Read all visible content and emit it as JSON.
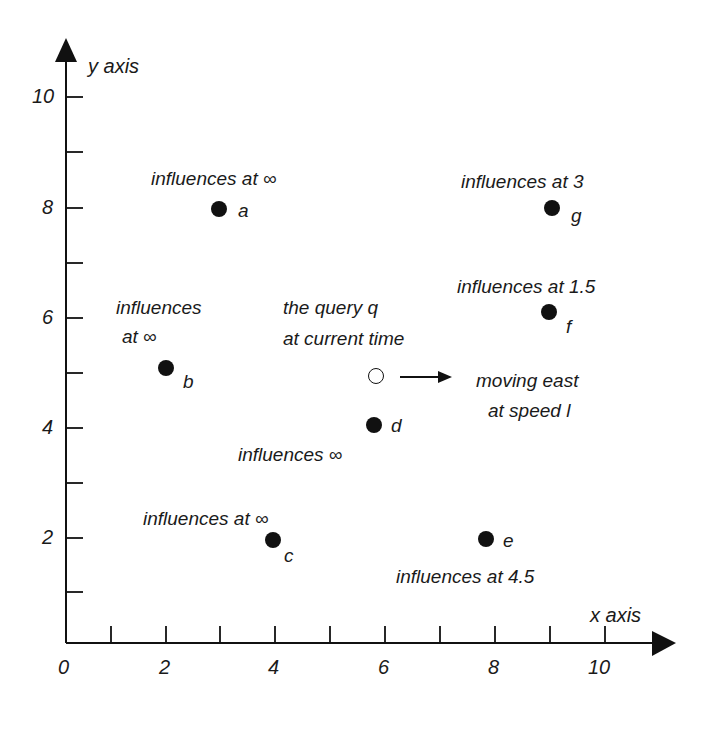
{
  "axes": {
    "x_label": "x axis",
    "y_label": "y axis",
    "x_ticks": [
      "0",
      "2",
      "4",
      "6",
      "8",
      "10"
    ],
    "y_ticks": [
      "10",
      "8",
      "6",
      "4",
      "2"
    ]
  },
  "points": [
    {
      "id": "a",
      "label": "a",
      "annotation": "influences at ∞",
      "x": 2.9,
      "y": 8.0,
      "filled": true
    },
    {
      "id": "b",
      "label": "b",
      "annotation_line1": "influences",
      "annotation_line2": "at ∞",
      "x": 1.9,
      "y": 5.1,
      "filled": true
    },
    {
      "id": "c",
      "label": "c",
      "annotation": "influences at ∞",
      "x": 3.9,
      "y": 2.0,
      "filled": true
    },
    {
      "id": "d",
      "label": "d",
      "annotation": "influences ∞",
      "x": 5.8,
      "y": 4.1,
      "filled": true
    },
    {
      "id": "e",
      "label": "e",
      "annotation": "influences at 4.5",
      "x": 7.9,
      "y": 2.0,
      "filled": true
    },
    {
      "id": "f",
      "label": "f",
      "annotation": "influences at 1.5",
      "x": 9.0,
      "y": 6.1,
      "filled": true
    },
    {
      "id": "g",
      "label": "g",
      "annotation": "influences at 3",
      "x": 9.1,
      "y": 8.0,
      "filled": true
    }
  ],
  "query": {
    "line1": "the query q",
    "line2": "at current time",
    "x": 5.8,
    "y": 4.9,
    "motion_line1": "moving east",
    "motion_line2": "at speed l"
  },
  "colors": {
    "ink": "#111111",
    "background": "#ffffff"
  }
}
